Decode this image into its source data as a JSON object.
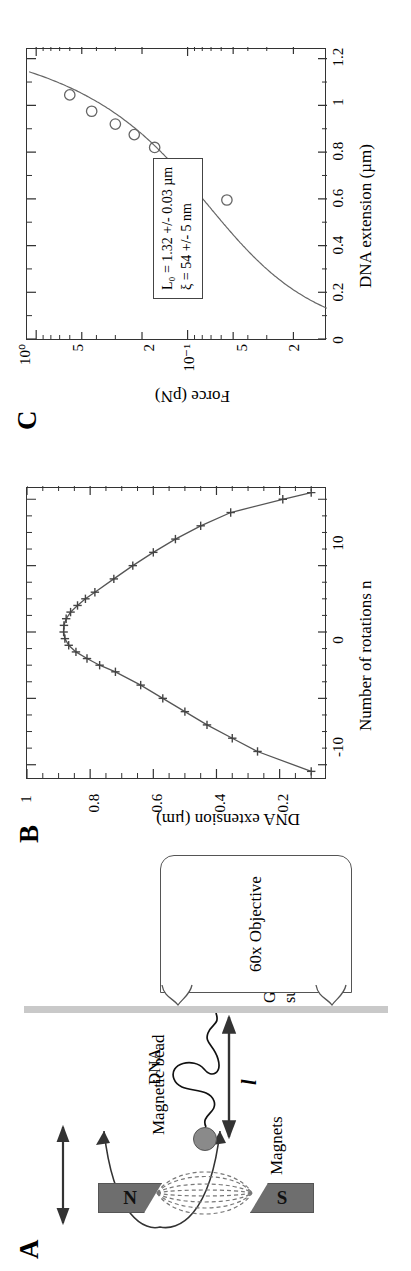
{
  "figure": {
    "panels": [
      {
        "letter": "A",
        "kind": "schematic"
      },
      {
        "letter": "B",
        "kind": "chart"
      },
      {
        "letter": "C",
        "kind": "chart"
      }
    ]
  },
  "panel_a": {
    "letter": "A",
    "labels": {
      "magnets": "Magnets",
      "magnetic_bead": "Magnetic bead",
      "dna": "DNA",
      "glass_surface_line1": "Glass",
      "glass_surface_line2": "surface",
      "objective": "60x Objective",
      "extension_symbol": "l",
      "magnet_north": "N",
      "magnet_south": "S"
    },
    "colors": {
      "magnet_fill": "#6e6e6e",
      "bead_fill": "#8a8a8a",
      "glass_fill": "#c9c9c9",
      "stroke": "#333333"
    }
  },
  "chart_data": [
    {
      "panel": "B",
      "type": "line",
      "title": "",
      "xlabel": "Number of rotations n",
      "ylabel": "DNA extension (µm)",
      "xlim": [
        -22,
        22
      ],
      "ylim": [
        0.05,
        1.0
      ],
      "xticks": [
        -10,
        0,
        10
      ],
      "xticklabels": [
        "-10",
        "0",
        "10"
      ],
      "yticks": [
        0.2,
        0.4,
        0.6,
        0.8,
        1
      ],
      "yticklabels": [
        "0.2",
        "0.4",
        "0.6",
        "0.8",
        "1"
      ],
      "grid": false,
      "legend": "none",
      "marker": "plus",
      "x": [
        -21,
        -18,
        -16,
        -14,
        -12,
        -10,
        -8,
        -6,
        -5,
        -4,
        -3,
        -2,
        -1,
        0,
        1,
        2,
        3,
        4,
        5,
        6,
        8,
        10,
        12,
        14,
        16,
        18,
        20,
        21
      ],
      "y": [
        0.1,
        0.27,
        0.35,
        0.43,
        0.5,
        0.57,
        0.64,
        0.72,
        0.77,
        0.81,
        0.845,
        0.868,
        0.88,
        0.884,
        0.883,
        0.876,
        0.862,
        0.84,
        0.815,
        0.785,
        0.725,
        0.665,
        0.6,
        0.53,
        0.45,
        0.355,
        0.19,
        0.1
      ]
    },
    {
      "panel": "C",
      "type": "scatter",
      "title": "",
      "xlabel": "DNA extension (µm)",
      "ylabel": "Force (pN)",
      "xlim": [
        0,
        1.25
      ],
      "ylim": [
        0.012,
        1.15
      ],
      "yscale": "log",
      "xticks": [
        0,
        0.2,
        0.4,
        0.6,
        0.8,
        1,
        1.2
      ],
      "xticklabels": [
        "0",
        "0.2",
        "0.4",
        "0.6",
        "0.8",
        "1",
        "1.2"
      ],
      "yticks": [
        1,
        0.5,
        0.2,
        0.1,
        0.05,
        0.02
      ],
      "yticklabels": [
        "10⁰",
        "5",
        "2",
        "10⁻¹",
        "5",
        "2"
      ],
      "grid": false,
      "marker": "open-circle",
      "points_x": [
        0.595,
        0.74,
        0.82,
        0.875,
        0.92,
        0.975,
        1.045
      ],
      "points_y": [
        0.055,
        0.105,
        0.165,
        0.225,
        0.3,
        0.43,
        0.6
      ],
      "fit_curve_label": "worm-like chain fit",
      "annotation": {
        "line1": "L₀ = 1.32 +/- 0.03 µm",
        "line2": "ξ = 54 +/- 5 nm"
      }
    }
  ]
}
